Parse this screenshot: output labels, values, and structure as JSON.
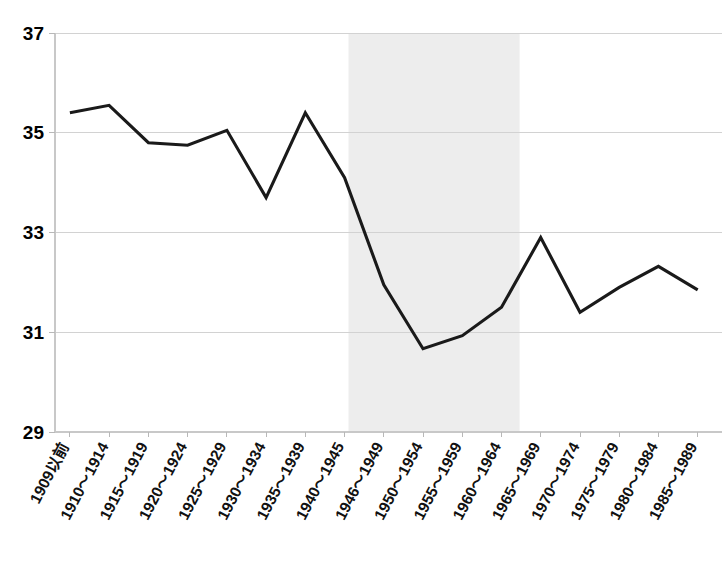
{
  "chart_data": {
    "type": "line",
    "title": "",
    "subtitle": "",
    "xlabel": "",
    "ylabel": "",
    "ylim": [
      29,
      37
    ],
    "yticks": [
      29,
      31,
      33,
      35,
      37
    ],
    "ytick_labels": [
      "29",
      "31",
      "33",
      "35",
      "37"
    ],
    "grid": true,
    "legend": "none",
    "categories": [
      "1909以前",
      "1910～1914",
      "1915～1919",
      "1920～1924",
      "1925～1929",
      "1930～1934",
      "1935～1939",
      "1940～1945",
      "1946～1949",
      "1950～1954",
      "1955～1959",
      "1960～1964",
      "1965～1969",
      "1970～1974",
      "1975～1979",
      "1980～1984",
      "1985～1989"
    ],
    "values": [
      35.4,
      35.55,
      34.8,
      34.75,
      35.05,
      33.7,
      35.4,
      34.1,
      31.95,
      30.67,
      30.93,
      31.5,
      32.9,
      31.4,
      31.9,
      32.32,
      31.85
    ],
    "series": [
      {
        "name": "series-1",
        "color": "#1a1a1a",
        "values": [
          35.4,
          35.55,
          34.8,
          34.75,
          35.05,
          33.7,
          35.4,
          34.1,
          31.95,
          30.67,
          30.93,
          31.5,
          32.9,
          31.4,
          31.9,
          32.32,
          31.85
        ]
      }
    ],
    "annotations": [
      {
        "name": "highlight-band",
        "type": "vertical-span",
        "from_category": "1946～1949",
        "to_category": "1960～1964",
        "color": "#ededed",
        "label": ""
      }
    ]
  },
  "axes": {
    "y_tick_0": "29",
    "y_tick_1": "31",
    "y_tick_2": "33",
    "y_tick_3": "35",
    "y_tick_4": "37"
  },
  "colors": {
    "line": "#1a1a1a",
    "grid": "#d2d2d2",
    "band": "#ededed",
    "background": "#ffffff",
    "text": "#000000"
  }
}
